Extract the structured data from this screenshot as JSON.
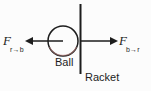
{
  "figure": {
    "type": "free-body-force-pair-diagram",
    "background_color": "#fcfcfc",
    "ink_color": "#1d1d1d",
    "width": 151,
    "height": 91
  },
  "objects": {
    "ball": {
      "label": "Ball",
      "shape": "circle",
      "center_x": 63,
      "center_y": 41,
      "radius": 15,
      "tint_color": "#c88a86"
    },
    "racket": {
      "label": "Racket",
      "shape": "vertical-line",
      "x": 80,
      "y_top": 4,
      "y_bottom": 74
    }
  },
  "forces": [
    {
      "id": "force-racket-on-ball",
      "symbol": "F",
      "subscript": "r→b",
      "direction": "left",
      "meaning": "force of racket on ball",
      "shaft_from_x": 63,
      "shaft_to_x": 27,
      "y": 41,
      "tip_x": 25
    },
    {
      "id": "force-ball-on-racket",
      "symbol": "F",
      "subscript": "b→r",
      "direction": "right",
      "meaning": "force of ball on racket",
      "shaft_from_x": 80,
      "shaft_to_x": 116,
      "y": 41,
      "tip_x": 118
    }
  ]
}
